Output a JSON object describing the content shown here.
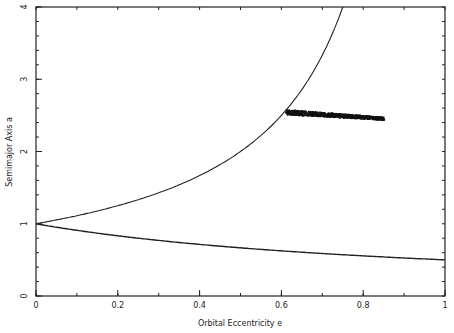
{
  "chart_data": {
    "type": "line",
    "title": "",
    "xlabel": "Orbital Eccentricity e",
    "ylabel": "Semimajor Axis a",
    "xlim": [
      0,
      1
    ],
    "ylim": [
      0,
      4
    ],
    "grid": false,
    "legend": null,
    "x_ticks": [
      "0",
      "0.2",
      "0.4",
      "0.6",
      "0.8",
      "1"
    ],
    "x_tick_values": [
      0,
      0.2,
      0.4,
      0.6,
      0.8,
      1
    ],
    "x_minor_step": 0.1,
    "y_ticks": [
      "0",
      "1",
      "2",
      "3",
      "4"
    ],
    "y_tick_values": [
      0,
      1,
      2,
      3,
      4
    ],
    "y_minor_step": 0.2,
    "series": [
      {
        "name": "upper boundary a = 1/(1-e)",
        "type": "line",
        "x": [
          0,
          0.1,
          0.2,
          0.3,
          0.4,
          0.5,
          0.55,
          0.6,
          0.65,
          0.7,
          0.75
        ],
        "values": [
          1.0,
          1.11,
          1.25,
          1.43,
          1.67,
          2.0,
          2.22,
          2.5,
          2.86,
          3.33,
          4.0
        ]
      },
      {
        "name": "lower boundary a = 1/(1+e)",
        "type": "line",
        "x": [
          0,
          0.1,
          0.2,
          0.3,
          0.4,
          0.5,
          0.6,
          0.7,
          0.8,
          0.9,
          1.0
        ],
        "values": [
          1.0,
          0.91,
          0.83,
          0.77,
          0.71,
          0.67,
          0.63,
          0.59,
          0.56,
          0.53,
          0.5
        ]
      },
      {
        "name": "orbit cluster",
        "type": "scatter",
        "x_range": [
          0.61,
          0.85
        ],
        "y_range": [
          2.45,
          2.57
        ],
        "x": [
          0.61,
          0.63,
          0.65,
          0.67,
          0.69,
          0.71,
          0.73,
          0.75,
          0.77,
          0.79,
          0.81,
          0.83,
          0.85
        ],
        "values": [
          2.55,
          2.54,
          2.53,
          2.53,
          2.52,
          2.52,
          2.51,
          2.51,
          2.5,
          2.49,
          2.48,
          2.47,
          2.46
        ]
      }
    ]
  }
}
